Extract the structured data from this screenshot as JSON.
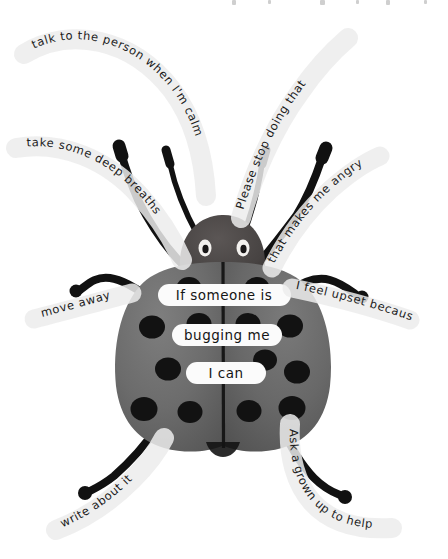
{
  "page": {
    "title": "If someone is bugging me I can",
    "background_color": "#ffffff",
    "illustration": "ladybug-bug-coping-strategies-poster"
  },
  "colors": {
    "ink": "#1b1b1b",
    "body_gray": "#6d6d6d",
    "body_gray_dark": "#5a5a5a",
    "head_gray": "#4a4645",
    "spot_black": "#121212",
    "leg_black": "#111111",
    "label_white": "#fdfdfd",
    "highlight_gray": "#ededed",
    "paper": "#ffffff"
  },
  "center_labels": [
    {
      "id": "line-1",
      "text": "If someone is"
    },
    {
      "id": "line-2",
      "text": "bugging me"
    },
    {
      "id": "line-3",
      "text": "I can"
    }
  ],
  "strategies": [
    {
      "id": "talk-to-person",
      "text": "talk to the person when I'm calm",
      "limb": "antenna-left",
      "position": "top-left"
    },
    {
      "id": "please-stop",
      "text": "Please stop doing that",
      "limb": "antenna-right",
      "position": "top-right"
    },
    {
      "id": "deep-breaths",
      "text": "take some deep breaths",
      "limb": "leg-upper-left",
      "position": "left-upper"
    },
    {
      "id": "makes-me-angry",
      "text": "that makes me angry",
      "limb": "leg-upper-right",
      "position": "right-upper"
    },
    {
      "id": "move-away",
      "text": "move away",
      "limb": "leg-middle-left",
      "position": "left-middle"
    },
    {
      "id": "i-feel-upset",
      "text": "I feel upset because",
      "limb": "leg-middle-right",
      "position": "right-middle"
    },
    {
      "id": "write-about-it",
      "text": "write about it",
      "limb": "leg-lower-left",
      "position": "bottom-left"
    },
    {
      "id": "ask-grown-up",
      "text": "Ask a grown up to help",
      "limb": "leg-lower-right",
      "position": "bottom-right"
    }
  ],
  "bug": {
    "name": "ladybug",
    "parts": [
      "head",
      "two-antennae",
      "two-eyes",
      "left-elytron",
      "right-elytron",
      "six-legs"
    ],
    "spot_count_left": 7,
    "spot_count_right": 7
  }
}
